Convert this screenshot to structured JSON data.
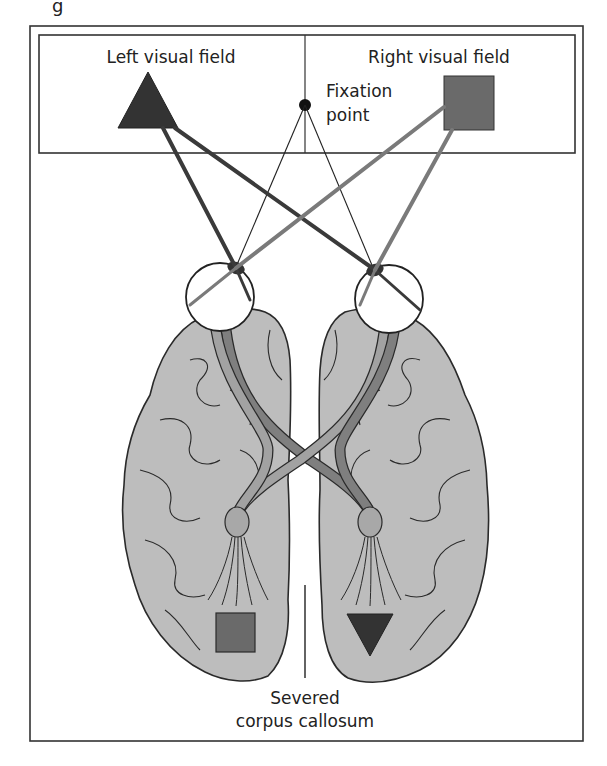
{
  "figure": {
    "caption_fragment": "g",
    "labels": {
      "left_field": "Left visual field",
      "right_field": "Right visual field",
      "fixation_line1": "Fixation",
      "fixation_line2": "point",
      "severed_line1": "Severed",
      "severed_line2": "corpus callosum"
    },
    "objects": {
      "left_field_shape": "triangle",
      "right_field_shape": "square",
      "left_hemisphere_percept": "square",
      "right_hemisphere_percept": "inverted-triangle"
    },
    "colors": {
      "frame": "#333333",
      "triangle_fill": "#333333",
      "square_fill": "#6a6a6a",
      "brain_fill": "#bdbdbd",
      "brain_outline": "#2a2a2a",
      "tract_dark": "#7f7f7f",
      "tract_light": "#a2a2a2",
      "dark_ray": "#3a3a3a",
      "grey_ray": "#7a7a7a"
    }
  }
}
